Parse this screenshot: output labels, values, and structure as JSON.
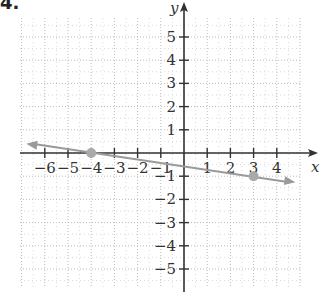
{
  "problem": {
    "number": "4."
  },
  "chart_data": {
    "type": "line",
    "title": "",
    "xlabel": "x",
    "ylabel": "y",
    "xlim": [
      -7,
      5
    ],
    "ylim": [
      -6,
      6
    ],
    "grid": true,
    "x_ticks": [
      -6,
      -5,
      -4,
      -3,
      -2,
      -1,
      1,
      2,
      3,
      4
    ],
    "y_ticks": [
      5,
      4,
      3,
      2,
      1,
      -1,
      -2,
      -3,
      -4,
      -5
    ],
    "x_tick_labels": [
      "−6",
      "−5",
      "−4",
      "−3",
      "−2",
      "−1",
      "1",
      "2",
      "3",
      "4"
    ],
    "y_tick_labels": [
      "5",
      "4",
      "3",
      "2",
      "1",
      "−1",
      "−2",
      "−3",
      "−4",
      "−5"
    ],
    "series": [
      {
        "name": "line",
        "slope": -0.142857,
        "intercept": -0.571429,
        "points": [
          {
            "x": -4,
            "y": 0
          },
          {
            "x": 3,
            "y": -1
          }
        ],
        "x_range": [
          -6.8,
          4.8
        ],
        "color": "#999999",
        "arrows": "both"
      }
    ]
  },
  "colors": {
    "axis": "#333333",
    "grid": "#bbbbbb",
    "line": "#9a9a9a",
    "point": "#aaaaaa"
  }
}
